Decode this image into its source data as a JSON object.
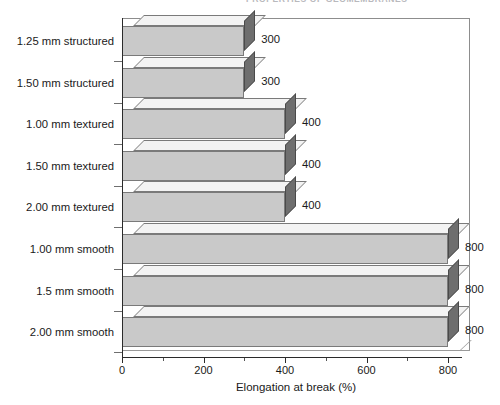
{
  "header": {
    "clipped_title": "PROPERTIES OF GEOMEMBRANES"
  },
  "chart_data": {
    "type": "bar",
    "orientation": "horizontal",
    "title": "",
    "subtitle": "",
    "xlabel": "Elongation at break (%)",
    "ylabel": "",
    "xlim": [
      0,
      900
    ],
    "xticks": [
      0,
      200,
      400,
      600,
      800
    ],
    "xtick_labels": [
      "0",
      "200",
      "400",
      "600",
      "800"
    ],
    "minor_tick_interval": 100,
    "grid": false,
    "legend": null,
    "style": "3d-isometric",
    "categories": [
      "1.25 mm structured",
      "1.50 mm structured",
      "1.00 mm textured",
      "1.50 mm textured",
      "2.00 mm textured",
      "1.00 mm smooth",
      "1.5 mm smooth",
      "2.00 mm smooth"
    ],
    "values": [
      300,
      300,
      400,
      400,
      400,
      800,
      800,
      800
    ],
    "value_labels": [
      "300",
      "300",
      "400",
      "400",
      "400",
      "800",
      "800",
      "800"
    ],
    "colors": {
      "bar_front": "#c9c9c9",
      "bar_side": "#6e6e6e",
      "bar_top": "#f3f3f3",
      "bar_edge": "#7a7a7a",
      "axis": "#2b2b2b",
      "frame": "#8d8d8d",
      "text": "#1a1a1a",
      "background": "#ffffff"
    }
  }
}
